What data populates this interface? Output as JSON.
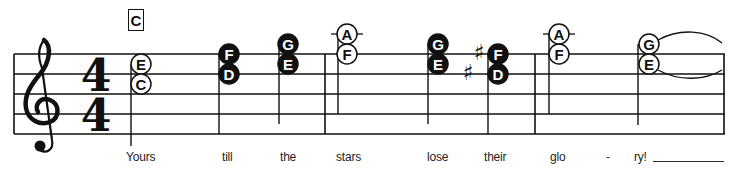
{
  "chord_symbol": "C",
  "clef": "treble",
  "time_signature": {
    "numerator": "4",
    "denominator": "4"
  },
  "colors": {
    "ink": "#111111",
    "paper": "#ffffff"
  },
  "notes": [
    {
      "syllable": "Yours",
      "pitches": [
        "E",
        "C"
      ],
      "filled": false,
      "accidentals": []
    },
    {
      "syllable": "till",
      "pitches": [
        "F",
        "D"
      ],
      "filled": true,
      "accidentals": []
    },
    {
      "syllable": "the",
      "pitches": [
        "G",
        "E"
      ],
      "filled": true,
      "accidentals": []
    },
    {
      "syllable": "stars",
      "pitches": [
        "A",
        "F"
      ],
      "filled": false,
      "accidentals": []
    },
    {
      "syllable": "lose",
      "pitches": [
        "G",
        "E"
      ],
      "filled": true,
      "accidentals": []
    },
    {
      "syllable": "their",
      "pitches": [
        "F",
        "D"
      ],
      "filled": true,
      "accidentals": [
        "sharp",
        "sharp"
      ]
    },
    {
      "syllable": "glo",
      "pitches": [
        "A",
        "F"
      ],
      "filled": false,
      "accidentals": []
    },
    {
      "syllable": "ry!",
      "pitches": [
        "G",
        "E"
      ],
      "filled": false,
      "accidentals": [],
      "tied": true
    }
  ],
  "lyrics": {
    "w0": "Yours",
    "w1": "till",
    "w2": "the",
    "w3": "stars",
    "w4": "lose",
    "w5": "their",
    "w6": "glo",
    "hyphen": "-",
    "w7": "ry!"
  },
  "accidental_glyph": "♯",
  "icons": {
    "clef": "treble-clef-icon",
    "sharp": "sharp-icon"
  }
}
